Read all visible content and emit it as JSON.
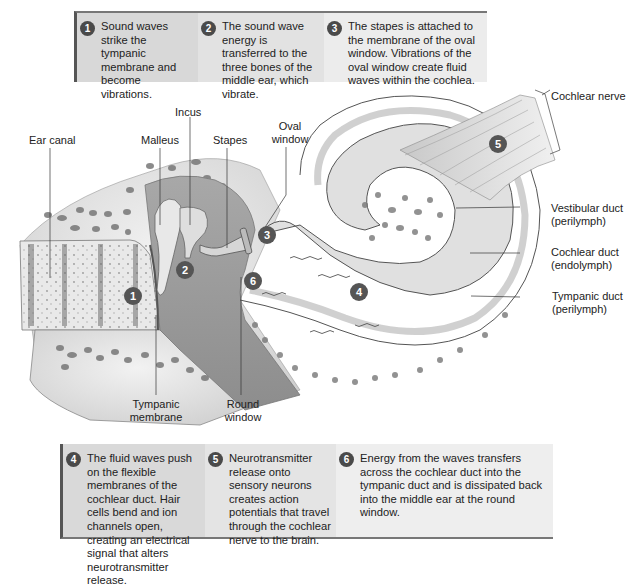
{
  "figure": {
    "top_steps": [
      {
        "number": "1",
        "text": "Sound waves strike the tympanic membrane and become vibrations."
      },
      {
        "number": "2",
        "text": "The sound wave energy is transferred to the three bones of the middle ear, which vibrate."
      },
      {
        "number": "3",
        "text": "The stapes is attached to the membrane of the oval window. Vibrations of the oval window create fluid waves within the cochlea."
      }
    ],
    "bottom_steps": [
      {
        "number": "4",
        "text": "The fluid waves push on the flexible membranes of the cochlear duct. Hair cells bend and ion channels open, creating an electrical signal that alters neurotransmitter release."
      },
      {
        "number": "5",
        "text": "Neurotransmitter release onto sensory neurons creates action potentials that travel through the cochlear nerve to the brain."
      },
      {
        "number": "6",
        "text": "Energy from the waves transfers across the cochlear duct into the tympanic duct and is dissipated back into the middle ear at the round window."
      }
    ],
    "labels": {
      "ear_canal": "Ear canal",
      "malleus": "Malleus",
      "incus": "Incus",
      "stapes": "Stapes",
      "oval_window_1": "Oval",
      "oval_window_2": "window",
      "cochlear_nerve": "Cochlear nerve",
      "vestibular_duct_1": "Vestibular duct",
      "vestibular_duct_2": "(perilymph)",
      "cochlear_duct_1": "Cochlear duct",
      "cochlear_duct_2": "(endolymph)",
      "tympanic_duct_1": "Tympanic duct",
      "tympanic_duct_2": "(perilymph)",
      "tympanic_membrane_1": "Tympanic",
      "tympanic_membrane_2": "membrane",
      "round_window_1": "Round",
      "round_window_2": "window"
    },
    "markers": [
      "1",
      "2",
      "3",
      "4",
      "5",
      "6"
    ]
  }
}
